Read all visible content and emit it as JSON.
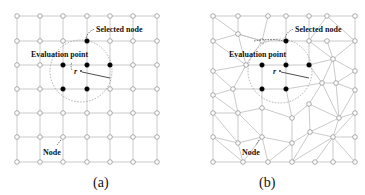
{
  "panels": [
    {
      "id": "a",
      "caption": "(a)",
      "mesh_type": "regular grid",
      "labels": {
        "selected_node": "Selected node",
        "evaluation_point": "Evaluation point",
        "node": "Node",
        "radius_symbol": "r"
      }
    },
    {
      "id": "b",
      "caption": "(b)",
      "mesh_type": "irregular triangular mesh",
      "labels": {
        "selected_node": "Selected node",
        "evaluation_point": "Evaluation point",
        "node": "Node",
        "radius_symbol": "r"
      }
    }
  ],
  "colors": {
    "edge": "#bdbdbd",
    "selected_node": "#000000",
    "open_node": "#ffffff"
  }
}
